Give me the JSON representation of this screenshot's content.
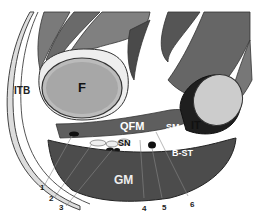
{
  "figure": {
    "title": "",
    "labels": {
      "itb": "ITB",
      "f": "F",
      "qfm": "QFM",
      "sn": "SN",
      "sm": "SM",
      "it": "IT",
      "bst": "B-ST",
      "gm": "GM"
    },
    "numbers": [
      "1",
      "2",
      "3",
      "4",
      "5",
      "6"
    ]
  }
}
